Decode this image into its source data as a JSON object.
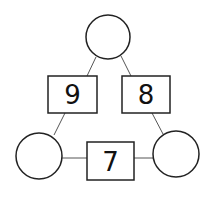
{
  "diagram": {
    "type": "number-triangle",
    "colors": {
      "stroke": "#222222",
      "line": "#555555",
      "text": "#111111",
      "background": "#ffffff"
    },
    "circles": [
      {
        "id": "top",
        "value": "",
        "cx": 108,
        "cy": 37,
        "r": 22
      },
      {
        "id": "bottom-left",
        "value": "",
        "cx": 39,
        "cy": 156,
        "r": 23
      },
      {
        "id": "bottom-right",
        "value": "",
        "cx": 176,
        "cy": 154,
        "r": 23
      }
    ],
    "boxes": [
      {
        "id": "left",
        "value": "9",
        "x": 48,
        "y": 76,
        "w": 49,
        "h": 37
      },
      {
        "id": "right",
        "value": "8",
        "x": 122,
        "y": 76,
        "w": 48,
        "h": 37
      },
      {
        "id": "bottom",
        "value": "7",
        "x": 87,
        "y": 142,
        "w": 47,
        "h": 38
      }
    ]
  }
}
